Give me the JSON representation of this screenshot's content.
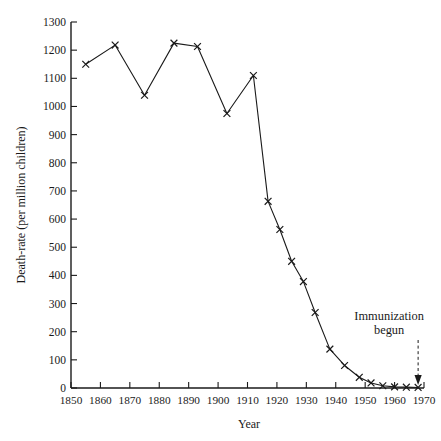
{
  "chart_data": {
    "type": "line",
    "title": "",
    "xlabel": "Year",
    "ylabel": "Death-rate (per million children)",
    "xlim": [
      1850,
      1970
    ],
    "ylim": [
      0,
      1300
    ],
    "xticks": [
      1850,
      1860,
      1870,
      1880,
      1890,
      1900,
      1910,
      1920,
      1930,
      1940,
      1950,
      1960,
      1970
    ],
    "yticks": [
      0,
      100,
      200,
      300,
      400,
      500,
      600,
      700,
      800,
      900,
      1000,
      1100,
      1200,
      1300
    ],
    "grid": false,
    "legend": "none",
    "marker": "x",
    "series": [
      {
        "name": "Death-rate",
        "x": [
          1855,
          1865,
          1875,
          1885,
          1893,
          1903,
          1912,
          1917,
          1921,
          1925,
          1929,
          1933,
          1938,
          1943,
          1948,
          1952,
          1956,
          1960,
          1964,
          1968
        ],
        "values": [
          1150,
          1218,
          1040,
          1225,
          1213,
          975,
          1110,
          663,
          563,
          450,
          378,
          268,
          138,
          80,
          38,
          18,
          8,
          4,
          3,
          2
        ]
      }
    ],
    "annotations": [
      {
        "name": "immunization-begun",
        "line1": "Immunization",
        "line2": "begun",
        "x": 1968,
        "arrow": "down"
      }
    ],
    "colors": {
      "ink": "#1a1a1a",
      "background": "#ffffff"
    }
  }
}
